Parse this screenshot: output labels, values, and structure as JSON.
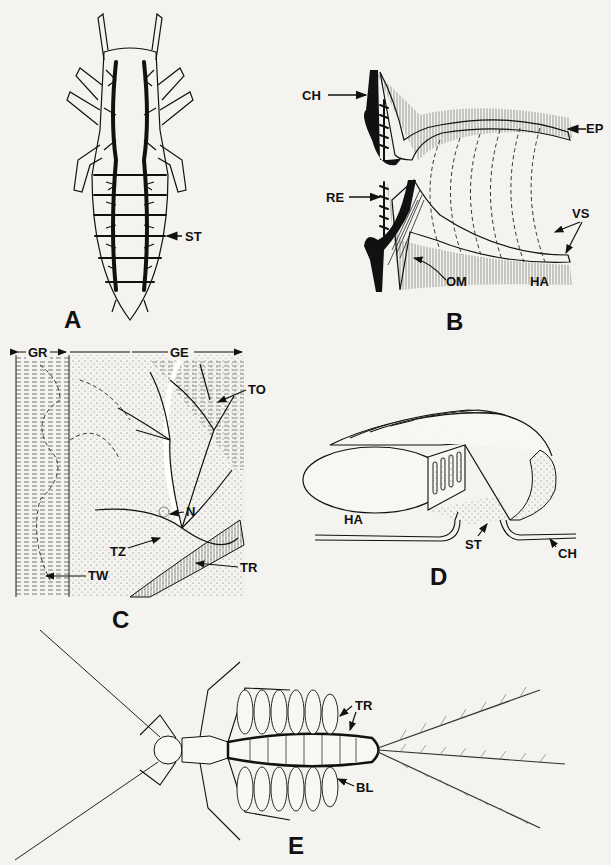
{
  "figure": {
    "panels": [
      {
        "id": "A",
        "letter": "A",
        "labels": {
          "st": "ST"
        }
      },
      {
        "id": "B",
        "letter": "B",
        "labels": {
          "ch": "CH",
          "ep": "EP",
          "re": "RE",
          "vs": "VS",
          "om": "OM",
          "ha": "HA"
        }
      },
      {
        "id": "C",
        "letter": "C",
        "labels": {
          "gr": "GR",
          "ge": "GE",
          "to": "TO",
          "n": "N",
          "tz": "TZ",
          "tr": "TR",
          "tw": "TW"
        }
      },
      {
        "id": "D",
        "letter": "D",
        "labels": {
          "ha": "HA",
          "st": "ST",
          "ch": "CH"
        }
      },
      {
        "id": "E",
        "letter": "E",
        "labels": {
          "tr": "TR",
          "bl": "BL"
        }
      }
    ],
    "colors": {
      "ink": "#111111",
      "paper": "#f4f3ef",
      "stipple": "#777777"
    }
  }
}
